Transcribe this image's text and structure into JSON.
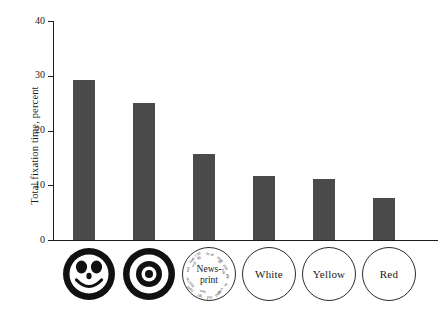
{
  "chart_data": {
    "type": "bar",
    "title": "",
    "xlabel": "",
    "ylabel": "Total fixation time, percent",
    "categories": [
      "Face",
      "Bullseye",
      "Newsprint",
      "White",
      "Yellow",
      "Red"
    ],
    "category_labels": [
      "",
      "",
      "News-print",
      "White",
      "Yellow",
      "Red"
    ],
    "values": [
      29.3,
      25.0,
      15.7,
      11.7,
      11.1,
      7.7
    ],
    "ylim": [
      0,
      40
    ],
    "yticks": [
      0,
      10,
      20,
      30,
      40
    ],
    "ytick_labels": [
      "0",
      "10",
      "20",
      "30",
      "40"
    ],
    "grid": false,
    "legend": false,
    "bar_color": "#4a4a4a",
    "axis_color": "#1a1a1a"
  },
  "axis": {
    "y_title": "Total fixation time, percent"
  },
  "categories": [
    {
      "id": "face",
      "kind": "glyph",
      "glyph": "smiley-face-icon",
      "label": ""
    },
    {
      "id": "bullseye",
      "kind": "glyph",
      "glyph": "bullseye-icon",
      "label": ""
    },
    {
      "id": "newsprint",
      "kind": "text",
      "glyph": "newsprint-icon",
      "label": "News-",
      "label2": "print"
    },
    {
      "id": "white",
      "kind": "text",
      "glyph": "plain-circle-icon",
      "label": "White"
    },
    {
      "id": "yellow",
      "kind": "text",
      "glyph": "plain-circle-icon",
      "label": "Yellow"
    },
    {
      "id": "red",
      "kind": "text",
      "glyph": "plain-circle-icon",
      "label": "Red"
    }
  ]
}
